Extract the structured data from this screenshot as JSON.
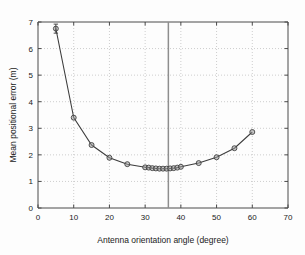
{
  "chart_data": {
    "type": "line",
    "title": "",
    "xlabel": "Antenna orientation angle (degree)",
    "ylabel": "Mean positional error (m)",
    "xlim": [
      0,
      70
    ],
    "ylim": [
      0,
      7
    ],
    "xticks": [
      0,
      10,
      20,
      30,
      40,
      50,
      60,
      70
    ],
    "yticks": [
      0,
      1,
      2,
      3,
      4,
      5,
      6,
      7
    ],
    "xticklabels": [
      "0",
      "10",
      "20",
      "30",
      "40",
      "50",
      "60",
      "70"
    ],
    "yticklabels": [
      "0",
      "1",
      "2",
      "3",
      "4",
      "5",
      "6",
      "7"
    ],
    "grid": true,
    "grid_style": "dotted",
    "legend": null,
    "marker": "circle",
    "series": [
      {
        "name": "mean positional error",
        "x": [
          5,
          10,
          15,
          20,
          25,
          30,
          31,
          32,
          33,
          34,
          35,
          36,
          37,
          38,
          39,
          40,
          45,
          50,
          55,
          60
        ],
        "y": [
          6.75,
          3.4,
          2.37,
          1.89,
          1.65,
          1.53,
          1.52,
          1.5,
          1.49,
          1.48,
          1.48,
          1.48,
          1.49,
          1.5,
          1.52,
          1.55,
          1.69,
          1.91,
          2.25,
          2.86
        ]
      }
    ],
    "errorbars": [
      {
        "x": 5,
        "y": 6.75,
        "lower": 6.58,
        "upper": 6.92
      }
    ],
    "annotations": [
      {
        "type": "vertical-line",
        "x": 36.5,
        "color": "#8e8e8e"
      }
    ]
  }
}
